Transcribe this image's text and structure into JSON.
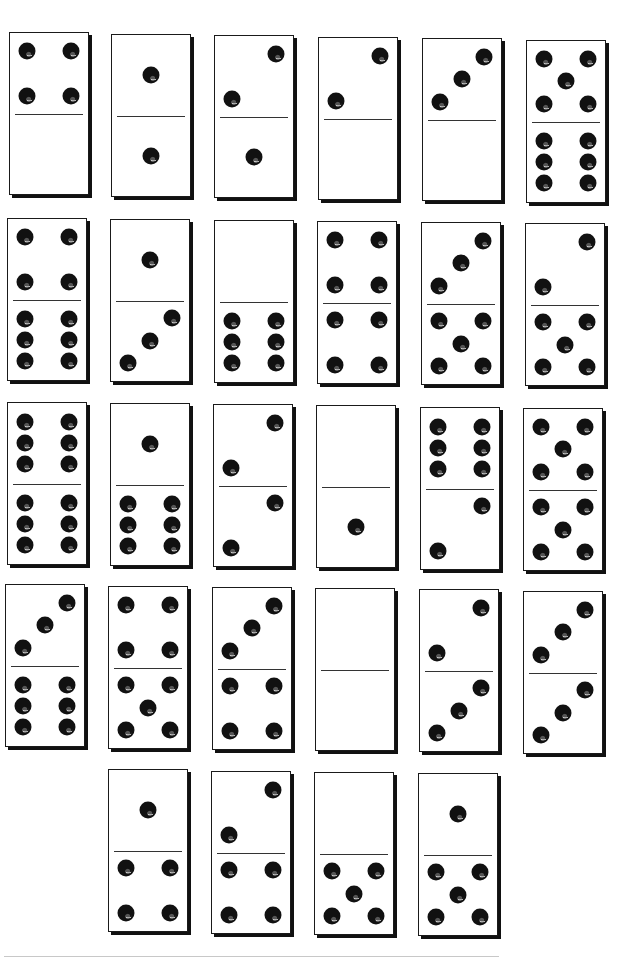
{
  "colors": {
    "domino_face": "#ffffff",
    "outline": "#1a1a1a",
    "pip": "#111111",
    "shadow": "#111111"
  },
  "dominoes": [
    {
      "id": 1,
      "row": 1,
      "x": 9,
      "y": 32,
      "top": 4,
      "bottom": 0
    },
    {
      "id": 2,
      "row": 1,
      "x": 111,
      "y": 34,
      "top": 1,
      "bottom": 1
    },
    {
      "id": 3,
      "row": 1,
      "x": 214,
      "y": 35,
      "top": 2,
      "bottom": 1
    },
    {
      "id": 4,
      "row": 1,
      "x": 318,
      "y": 37,
      "top": 2,
      "bottom": 0
    },
    {
      "id": 5,
      "row": 1,
      "x": 422,
      "y": 38,
      "top": 3,
      "bottom": 0
    },
    {
      "id": 6,
      "row": 1,
      "x": 526,
      "y": 40,
      "top": 5,
      "bottom": 6
    },
    {
      "id": 7,
      "row": 2,
      "x": 7,
      "y": 218,
      "top": 4,
      "bottom": 6
    },
    {
      "id": 8,
      "row": 2,
      "x": 110,
      "y": 219,
      "top": 1,
      "bottom": 3
    },
    {
      "id": 9,
      "row": 2,
      "x": 214,
      "y": 220,
      "top": 0,
      "bottom": 6
    },
    {
      "id": 10,
      "row": 2,
      "x": 317,
      "y": 221,
      "top": 4,
      "bottom": 4
    },
    {
      "id": 11,
      "row": 2,
      "x": 421,
      "y": 222,
      "top": 3,
      "bottom": 5
    },
    {
      "id": 12,
      "row": 2,
      "x": 525,
      "y": 223,
      "top": 2,
      "bottom": 5
    },
    {
      "id": 13,
      "row": 3,
      "x": 7,
      "y": 402,
      "top": 6,
      "bottom": 6
    },
    {
      "id": 14,
      "row": 3,
      "x": 110,
      "y": 403,
      "top": 1,
      "bottom": 6
    },
    {
      "id": 15,
      "row": 3,
      "x": 213,
      "y": 404,
      "top": 2,
      "bottom": 2
    },
    {
      "id": 16,
      "row": 3,
      "x": 316,
      "y": 405,
      "top": 0,
      "bottom": 1
    },
    {
      "id": 17,
      "row": 3,
      "x": 420,
      "y": 407,
      "top": 6,
      "bottom": 2
    },
    {
      "id": 18,
      "row": 3,
      "x": 523,
      "y": 408,
      "top": 5,
      "bottom": 5
    },
    {
      "id": 19,
      "row": 4,
      "x": 5,
      "y": 584,
      "top": 3,
      "bottom": 6
    },
    {
      "id": 20,
      "row": 4,
      "x": 108,
      "y": 586,
      "top": 4,
      "bottom": 5
    },
    {
      "id": 21,
      "row": 4,
      "x": 212,
      "y": 587,
      "top": 3,
      "bottom": 4
    },
    {
      "id": 22,
      "row": 4,
      "x": 315,
      "y": 588,
      "top": 0,
      "bottom": 0
    },
    {
      "id": 23,
      "row": 4,
      "x": 419,
      "y": 589,
      "top": 2,
      "bottom": 3
    },
    {
      "id": 24,
      "row": 4,
      "x": 523,
      "y": 591,
      "top": 3,
      "bottom": 3
    },
    {
      "id": 25,
      "row": 5,
      "x": 108,
      "y": 769,
      "top": 1,
      "bottom": 4
    },
    {
      "id": 26,
      "row": 5,
      "x": 211,
      "y": 771,
      "top": 2,
      "bottom": 4
    },
    {
      "id": 27,
      "row": 5,
      "x": 314,
      "y": 772,
      "top": 0,
      "bottom": 5
    },
    {
      "id": 28,
      "row": 5,
      "x": 418,
      "y": 773,
      "top": 1,
      "bottom": 5
    }
  ]
}
